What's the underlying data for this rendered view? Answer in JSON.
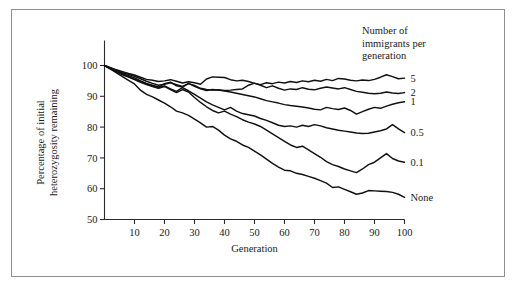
{
  "chart_data": {
    "type": "line",
    "title": "",
    "xlabel": "Generation",
    "ylabel": "Percentage of initial heterozygosity remaining",
    "ylabel_lines": [
      "Percentage of initial",
      "heterozygosity remaining"
    ],
    "xlim": [
      0,
      100
    ],
    "ylim": [
      50,
      100
    ],
    "xticks": [
      10,
      20,
      30,
      40,
      50,
      60,
      70,
      80,
      90,
      100
    ],
    "yticks": [
      50,
      60,
      70,
      80,
      90,
      100
    ],
    "grid": false,
    "legend_position": "right-of-plot",
    "legend_title_lines": [
      "Number of",
      "immigrants per",
      "generation"
    ],
    "legend_title": "Number of immigrants per generation",
    "x": [
      0,
      2,
      4,
      6,
      8,
      10,
      12,
      14,
      16,
      18,
      20,
      22,
      24,
      26,
      28,
      30,
      32,
      34,
      36,
      38,
      40,
      42,
      44,
      46,
      48,
      50,
      52,
      54,
      56,
      58,
      60,
      62,
      64,
      66,
      68,
      70,
      72,
      74,
      76,
      78,
      80,
      82,
      84,
      86,
      88,
      90,
      92,
      94,
      96,
      98,
      100
    ],
    "series": [
      {
        "name": "5",
        "label": "5",
        "label_y": 95.8,
        "values": [
          100,
          99.3,
          98.6,
          98.0,
          97.4,
          96.9,
          96.2,
          95.5,
          95.2,
          94.8,
          95.0,
          95.4,
          94.9,
          94.3,
          94.7,
          94.4,
          93.9,
          95.6,
          96.3,
          96.2,
          96.1,
          95.4,
          95.0,
          95.2,
          94.8,
          94.2,
          93.8,
          94.4,
          94.1,
          94.6,
          94.3,
          94.8,
          94.5,
          95.0,
          94.7,
          95.2,
          94.9,
          95.5,
          95.1,
          95.8,
          95.6,
          95.2,
          95.0,
          95.3,
          95.1,
          95.5,
          96.2,
          97.0,
          96.4,
          95.7,
          95.9
        ]
      },
      {
        "name": "2",
        "label": "2",
        "label_y": 91.2,
        "values": [
          100,
          99.2,
          98.4,
          97.7,
          97.1,
          96.5,
          95.7,
          94.9,
          94.2,
          93.6,
          93.9,
          94.4,
          93.8,
          93.2,
          94.1,
          93.5,
          92.6,
          92.2,
          92.0,
          92.1,
          91.9,
          92.0,
          92.2,
          92.4,
          93.6,
          94.3,
          93.6,
          92.8,
          93.4,
          92.6,
          92.0,
          92.4,
          92.2,
          92.8,
          92.3,
          92.1,
          92.6,
          93.0,
          92.7,
          92.4,
          92.8,
          92.2,
          91.6,
          91.3,
          91.0,
          90.8,
          91.0,
          91.4,
          91.1,
          90.9,
          91.2
        ]
      },
      {
        "name": "1",
        "label": "1",
        "label_y": 88.2,
        "values": [
          100,
          99.1,
          98.2,
          97.4,
          96.7,
          96.0,
          95.0,
          94.2,
          93.6,
          93.0,
          94.1,
          94.6,
          93.4,
          93.0,
          94.2,
          93.2,
          92.4,
          91.9,
          92.2,
          92.0,
          91.7,
          91.4,
          91.0,
          90.6,
          90.2,
          89.8,
          89.2,
          88.6,
          88.2,
          87.8,
          87.3,
          87.0,
          86.8,
          86.5,
          86.2,
          85.8,
          85.6,
          86.4,
          86.0,
          85.7,
          86.2,
          85.4,
          84.2,
          85.0,
          85.8,
          86.4,
          86.1,
          86.8,
          87.4,
          87.9,
          88.2
        ]
      },
      {
        "name": "0.5",
        "label": "0.5",
        "label_y": 78.2,
        "values": [
          100,
          99.0,
          98.1,
          97.2,
          96.4,
          95.6,
          94.8,
          94.0,
          93.4,
          92.8,
          93.4,
          92.4,
          91.6,
          92.8,
          91.8,
          90.6,
          89.4,
          88.2,
          87.2,
          86.4,
          85.6,
          86.4,
          85.2,
          84.4,
          84.0,
          83.6,
          82.8,
          82.2,
          81.4,
          80.6,
          80.2,
          80.4,
          80.0,
          80.6,
          80.2,
          80.8,
          80.4,
          79.8,
          79.4,
          79.0,
          78.7,
          78.4,
          78.1,
          77.9,
          78.0,
          78.4,
          78.8,
          79.4,
          80.8,
          79.4,
          78.2
        ]
      },
      {
        "name": "0.1",
        "label": "0.1",
        "label_y": 68.6,
        "values": [
          100,
          98.9,
          97.9,
          97.0,
          96.2,
          95.4,
          94.5,
          93.8,
          93.2,
          92.6,
          93.2,
          92.2,
          91.2,
          92.2,
          91.4,
          89.6,
          88.0,
          86.6,
          85.4,
          84.6,
          85.2,
          84.2,
          83.4,
          82.4,
          81.6,
          81.0,
          80.2,
          79.0,
          77.8,
          76.6,
          75.4,
          74.2,
          73.4,
          73.8,
          72.6,
          71.4,
          70.2,
          68.8,
          67.8,
          67.2,
          66.4,
          65.8,
          65.2,
          66.4,
          67.8,
          68.6,
          70.0,
          71.4,
          69.8,
          69.0,
          68.6
        ]
      },
      {
        "name": "None",
        "label": "None",
        "label_y": 57.2,
        "values": [
          100,
          98.8,
          97.6,
          96.4,
          95.2,
          94.0,
          92.0,
          90.6,
          89.8,
          88.8,
          87.8,
          86.6,
          85.2,
          84.6,
          83.8,
          82.6,
          81.4,
          80.0,
          80.2,
          79.0,
          77.4,
          76.2,
          75.4,
          74.2,
          73.4,
          72.2,
          71.0,
          69.6,
          68.2,
          67.0,
          66.0,
          65.8,
          65.0,
          64.6,
          64.0,
          63.4,
          62.6,
          61.8,
          60.4,
          60.6,
          59.8,
          59.0,
          58.2,
          58.6,
          59.4,
          59.3,
          59.2,
          59.1,
          58.8,
          58.2,
          57.2
        ]
      }
    ]
  }
}
